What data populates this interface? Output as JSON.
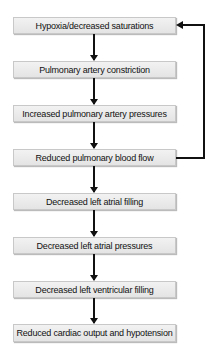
{
  "diagram": {
    "type": "flowchart",
    "nodes": [
      {
        "id": 1,
        "label": "Hypoxia/decreased saturations"
      },
      {
        "id": 2,
        "label": "Pulmonary artery constriction"
      },
      {
        "id": 3,
        "label": "Increased pulmonary artery pressures"
      },
      {
        "id": 4,
        "label": "Reduced pulmonary blood flow"
      },
      {
        "id": 5,
        "label": "Decreased left atrial filling"
      },
      {
        "id": 6,
        "label": "Decreased left atrial pressures"
      },
      {
        "id": 7,
        "label": "Decreased left ventricular filling"
      },
      {
        "id": 8,
        "label": "Reduced cardiac output and hypotension"
      }
    ],
    "edges": [
      {
        "from": 1,
        "to": 2
      },
      {
        "from": 2,
        "to": 3
      },
      {
        "from": 3,
        "to": 4
      },
      {
        "from": 4,
        "to": 5
      },
      {
        "from": 5,
        "to": 6
      },
      {
        "from": 6,
        "to": 7
      },
      {
        "from": 7,
        "to": 8
      },
      {
        "from": 4,
        "to": 1,
        "type": "feedback"
      }
    ]
  }
}
